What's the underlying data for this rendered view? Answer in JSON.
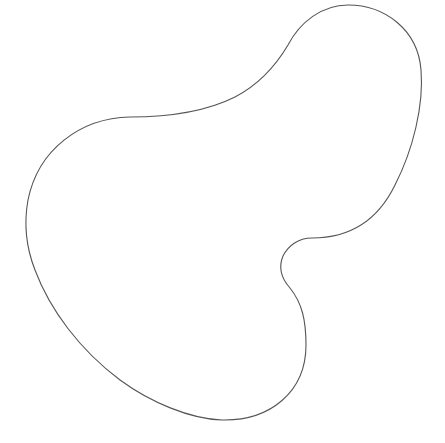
{
  "canvas": {
    "width": 445,
    "height": 443,
    "background": "#ffffff"
  },
  "shape": {
    "type": "closed-blob-outline",
    "stroke": "#555555",
    "stroke_width": 1.1,
    "fill": "none",
    "path": "M 348 5 C 385 5, 418 30, 421 70 C 424 105, 413 150, 395 185 C 378 220, 350 238, 312 238 C 298 238, 288 246, 283 256 C 278 268, 281 278, 290 288 C 302 303, 306 320, 306 345 C 306 392, 270 421, 222 420 C 190 419, 150 402, 120 380 C 80 350, 50 310, 35 270 C 26 247, 24 222, 28 200 C 38 150, 80 118, 130 117 C 170 117, 205 112, 235 97 C 258 85, 275 67, 288 45 C 300 22, 322 5, 348 5 Z"
  }
}
